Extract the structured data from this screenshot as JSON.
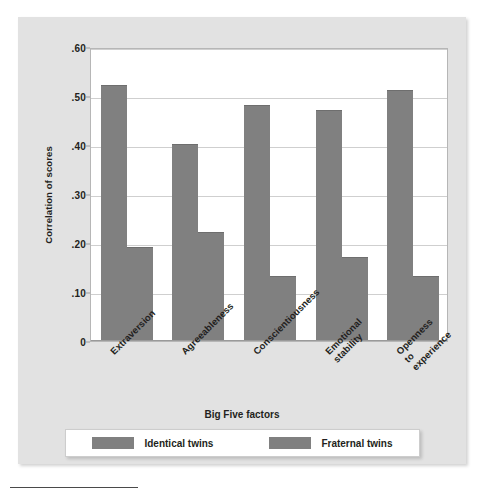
{
  "chart_data": {
    "type": "bar",
    "title": "",
    "xlabel": "Big Five factors",
    "ylabel": "Correlation of scores",
    "categories": [
      "Extraversion",
      "Agreeableness",
      "Conscientiousness",
      "Emotional\nstability",
      "Openness\nto\nexperience"
    ],
    "series": [
      {
        "name": "Identical twins",
        "values": [
          0.52,
          0.4,
          0.48,
          0.47,
          0.51
        ],
        "color": "#808080"
      },
      {
        "name": "Fraternal twins",
        "values": [
          0.19,
          0.22,
          0.13,
          0.17,
          0.13
        ],
        "color": "#808080"
      }
    ],
    "ylim": [
      0,
      0.6
    ],
    "yticks": [
      0.6,
      0.5,
      0.4,
      0.3,
      0.2,
      0.1,
      0
    ],
    "ytick_labels": [
      ".60",
      ".50",
      ".40",
      ".30",
      ".20",
      ".10",
      "0"
    ],
    "grid": true,
    "legend_position": "bottom"
  },
  "legend": {
    "items": [
      {
        "label": "Identical twins",
        "color": "#808080"
      },
      {
        "label": "Fraternal twins",
        "color": "#808080"
      }
    ]
  },
  "colors": {
    "bar": "#808080",
    "panel": "#e2e2e2",
    "plot_background": "#ffffff",
    "gridline": "#cfcfcf",
    "text": "#231f20"
  }
}
